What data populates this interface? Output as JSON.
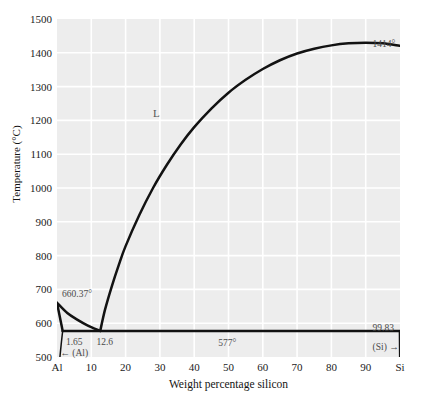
{
  "figure": {
    "width": 422,
    "height": 412,
    "background": "#ffffff",
    "plot_background": "#ededed",
    "grid_color": "#ffffff",
    "curve_color": "#121212"
  },
  "chart_data": {
    "type": "line",
    "title": "",
    "xlabel": "Weight percentage silicon",
    "ylabel": "Temperature (°C)",
    "xlim": [
      0,
      100
    ],
    "ylim": [
      500,
      1500
    ],
    "grid": true,
    "legend": "none",
    "xticks": [
      {
        "value": 0,
        "label": "Al"
      },
      {
        "value": 10,
        "label": "10"
      },
      {
        "value": 20,
        "label": "20"
      },
      {
        "value": 30,
        "label": "30"
      },
      {
        "value": 40,
        "label": "40"
      },
      {
        "value": 50,
        "label": "50"
      },
      {
        "value": 60,
        "label": "60"
      },
      {
        "value": 70,
        "label": "70"
      },
      {
        "value": 80,
        "label": "80"
      },
      {
        "value": 90,
        "label": "90"
      },
      {
        "value": 100,
        "label": "Si"
      }
    ],
    "yticks": [
      {
        "value": 500,
        "label": "500"
      },
      {
        "value": 600,
        "label": "600"
      },
      {
        "value": 700,
        "label": "700"
      },
      {
        "value": 800,
        "label": "800"
      },
      {
        "value": 900,
        "label": "900"
      },
      {
        "value": 1000,
        "label": "1000"
      },
      {
        "value": 1100,
        "label": "1100"
      },
      {
        "value": 1200,
        "label": "1200"
      },
      {
        "value": 1300,
        "label": "1300"
      },
      {
        "value": 1400,
        "label": "1400"
      },
      {
        "value": 1500,
        "label": "1500"
      }
    ],
    "series": [
      {
        "name": "Si-rich liquidus",
        "points": [
          [
            12.6,
            577
          ],
          [
            14,
            640
          ],
          [
            16,
            710
          ],
          [
            18,
            772
          ],
          [
            20,
            828
          ],
          [
            24,
            920
          ],
          [
            28,
            1000
          ],
          [
            32,
            1068
          ],
          [
            36,
            1128
          ],
          [
            40,
            1180
          ],
          [
            45,
            1235
          ],
          [
            50,
            1282
          ],
          [
            55,
            1320
          ],
          [
            60,
            1352
          ],
          [
            65,
            1378
          ],
          [
            70,
            1398
          ],
          [
            75,
            1412
          ],
          [
            80,
            1422
          ],
          [
            85,
            1428
          ],
          [
            90,
            1430
          ],
          [
            95,
            1428
          ],
          [
            99.83,
            1421
          ]
        ]
      },
      {
        "name": "Al-rich liquidus",
        "points": [
          [
            0,
            660.37
          ],
          [
            3,
            630
          ],
          [
            6,
            610
          ],
          [
            9,
            593
          ],
          [
            12.6,
            577
          ]
        ]
      },
      {
        "name": "Al-rich solidus",
        "points": [
          [
            0,
            660.37
          ],
          [
            0.7,
            625
          ],
          [
            1.2,
            600
          ],
          [
            1.65,
            577
          ]
        ]
      },
      {
        "name": "Al solvus",
        "points": [
          [
            1.65,
            577
          ],
          [
            1.3,
            545
          ],
          [
            1.0,
            515
          ],
          [
            0.85,
            500
          ]
        ]
      },
      {
        "name": "Eutectic isotherm",
        "points": [
          [
            1.65,
            577
          ],
          [
            99.83,
            577
          ]
        ]
      },
      {
        "name": "Si solvus",
        "points": [
          [
            99.83,
            577
          ],
          [
            99.9,
            500
          ]
        ]
      }
    ],
    "annotations": [
      {
        "id": "al-melting-point",
        "text": "660.37°",
        "x": 1.5,
        "y": 700
      },
      {
        "id": "alpha-solubility-limit",
        "text": "1.65",
        "x": 2.6,
        "y": 558
      },
      {
        "id": "eutectic-composition",
        "text": "12.6",
        "x": 11.5,
        "y": 558
      },
      {
        "id": "alpha-phase-label",
        "text": "← (Al)",
        "x": 1.0,
        "y": 527
      },
      {
        "id": "eutectic-temperature",
        "text": "577°",
        "x": 47,
        "y": 556
      },
      {
        "id": "liquid-region-label",
        "text": "L",
        "x": 28,
        "y": 1240
      },
      {
        "id": "si-melting-point",
        "text": "1414°",
        "x": 92,
        "y": 1440
      },
      {
        "id": "si-solubility-limit",
        "text": "99.83",
        "x": 92,
        "y": 600
      },
      {
        "id": "si-phase-label",
        "text": "(Si) →",
        "x": 92,
        "y": 545
      }
    ]
  }
}
